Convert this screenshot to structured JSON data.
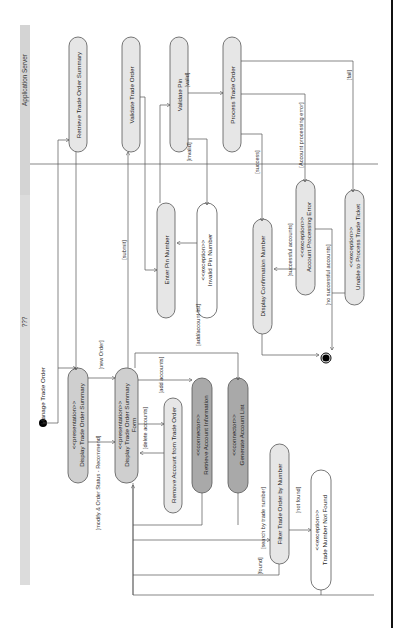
{
  "diagram": {
    "title": "???",
    "lane": "Application Server",
    "start_label": "Manage Trade Order",
    "nodes": {
      "retrieve_summary": "Retrieve Trade Order Summary",
      "validate_order": "Validate Trade Order",
      "validate_pin": "Validate Pin",
      "process_order": "Process Trade Order",
      "enter_pin": "Enter Pin Number",
      "invalid_pin_st": "<<exception>>",
      "invalid_pin": "Invalid Pin Number",
      "display_conf": "Display Confirmation Number",
      "acct_err_st": "<<exception>>",
      "acct_err": "Account Processing Error",
      "unable_st": "<<exception>>",
      "unable": "Unable to Process Trade Ticket",
      "disp_summary_st": "<<presentation>>",
      "disp_summary": "Display Trade Order Summary",
      "disp_form_st": "<<presentation>>",
      "disp_form_1": "Display Trade Order Summary",
      "disp_form_2": "Form",
      "remove_acct": "Remove Account from Trade Order",
      "retr_acct_st": "<<connector>>",
      "retr_acct": "Retrieve Account Information",
      "gen_list_st": "<<connector>>",
      "gen_list": "Generate Account List",
      "filter": "Filter Trade Order by Number",
      "notfound_st": "<<exception>>",
      "notfound": "Trade Number Not Found"
    },
    "guards": {
      "valid": "[valid]",
      "invalid": "[invalid]",
      "fail": "[fail]",
      "acct_error": "[Account processing error]",
      "success": "[success]",
      "successful_accounts": "[successful accounts]",
      "no_successful_accounts": "[no successful accounts]",
      "submit": "[submit]",
      "new_order": "[new Order]",
      "modify": "[modify & Order Status - Recommend]",
      "add_accounts": "[add accounts]",
      "delete_accounts": "[delete accounts]",
      "add_account_list": "[add/account list]",
      "search": "[search by trade number]",
      "not_found": "[not found]",
      "found": "[found]"
    }
  }
}
